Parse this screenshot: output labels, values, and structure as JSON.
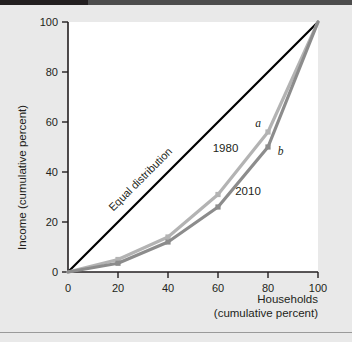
{
  "figure": {
    "background_color": "#e9e9e9",
    "plot_background_color": "#ffffff",
    "top_rule_dark_color": "#231f20",
    "top_rule_light_color": "#4d4d4d",
    "bottom_rule_color": "#9a9a9a"
  },
  "chart_data": {
    "type": "line",
    "title": "",
    "xlabel_line1": "Households",
    "xlabel_line2": "(cumulative percent)",
    "ylabel": "Income (cumulative percent)",
    "xlim": [
      0,
      100
    ],
    "ylim": [
      0,
      100
    ],
    "xticks": [
      0,
      20,
      40,
      60,
      80,
      100
    ],
    "yticks": [
      0,
      20,
      40,
      60,
      80,
      100
    ],
    "xticklabels": [
      "0",
      "20",
      "40",
      "60",
      "80",
      "100"
    ],
    "yticklabels": [
      "0",
      "20",
      "40",
      "60",
      "80",
      "100"
    ],
    "grid": false,
    "legend_position": "inline-annotations",
    "x": [
      0,
      20,
      40,
      60,
      80,
      100
    ],
    "series": [
      {
        "name": "Equal distribution",
        "label": "Equal distribution",
        "color": "#000000",
        "x": [
          0,
          100
        ],
        "values": [
          0,
          100
        ],
        "markers": false
      },
      {
        "name": "1980",
        "label": "1980",
        "color": "#b3b3b3",
        "values": [
          0,
          5,
          14,
          31,
          56,
          100
        ],
        "markers": true,
        "endpoint_label": "a"
      },
      {
        "name": "2010",
        "label": "2010",
        "color": "#8c8c8c",
        "values": [
          0,
          3.5,
          12,
          26,
          50,
          100
        ],
        "markers": true,
        "endpoint_label": "b"
      }
    ],
    "annotations": [
      {
        "text": "Equal distribution",
        "x": 30,
        "y": 36,
        "rotation": -45
      },
      {
        "text": "1980",
        "x": 63,
        "y": 48
      },
      {
        "text": "2010",
        "x": 72,
        "y": 31
      },
      {
        "text": "a",
        "x": 76,
        "y": 58
      },
      {
        "text": "b",
        "x": 85,
        "y": 47
      }
    ]
  }
}
